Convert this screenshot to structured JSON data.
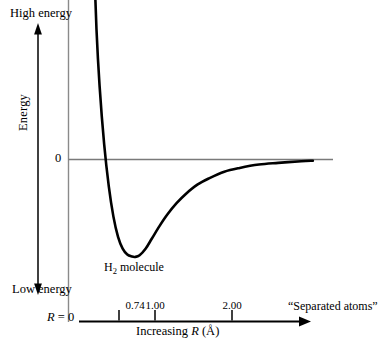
{
  "figure": {
    "kind": "potential-energy-curve",
    "background_color": "#ffffff",
    "line_color": "#000000",
    "axis_color": "#6b6b6b"
  },
  "labels": {
    "high_energy": "High energy",
    "low_energy": "Low energy",
    "energy_axis": "Energy",
    "zero": "0",
    "molecule_prefix": "H",
    "molecule_subscript": "2",
    "molecule_suffix": " molecule",
    "r_zero_symbol": "R",
    "r_zero_rest": " = 0",
    "separated_atoms": "“Separated atoms”",
    "xaxis_prefix": "Increasing ",
    "xaxis_symbol": "R",
    "xaxis_units": " (Å)"
  },
  "chart_data": {
    "type": "line",
    "title": "",
    "subtitle": "",
    "xlabel": "Increasing R (Å)",
    "ylabel": "Energy",
    "grid": false,
    "legend": null,
    "xlim": [
      0,
      3.1
    ],
    "ylim_note": "Energy axis unlabeled numerically; only zero level marked",
    "x_tick_labels": [
      "0.74",
      "1.00",
      "2.00"
    ],
    "x_tick_values": [
      0.74,
      1.0,
      2.0
    ],
    "y_tick_labels": [
      "0"
    ],
    "y_tick_values": [
      0
    ],
    "annotations": [
      {
        "text": "High energy",
        "position": "top of energy axis"
      },
      {
        "text": "Low energy",
        "position": "bottom of energy axis"
      },
      {
        "text": "H2 molecule",
        "position": "below curve minimum at R = 0.74"
      },
      {
        "text": "“Separated atoms”",
        "position": "right end of R axis"
      },
      {
        "text": "R = 0",
        "position": "origin of R axis"
      }
    ],
    "series": [
      {
        "name": "H2 potential energy",
        "description": "Morse-like potential: steep repulsive wall at small R, minimum at R = 0.74 A, asymptotic approach to zero energy at large R",
        "x": [
          0.12,
          0.16,
          0.2,
          0.24,
          0.28,
          0.34,
          0.4,
          0.46,
          0.52,
          0.58,
          0.64,
          0.7,
          0.74,
          0.8,
          0.88,
          0.96,
          1.06,
          1.16,
          1.28,
          1.4,
          1.55,
          1.7,
          1.9,
          2.1,
          2.35,
          2.6,
          2.9,
          3.05
        ],
        "y": [
          6.3,
          4.05,
          2.55,
          1.55,
          0.88,
          0.18,
          -0.32,
          -0.68,
          -0.92,
          -1.06,
          -1.13,
          -1.155,
          -1.16,
          -1.14,
          -1.06,
          -0.94,
          -0.79,
          -0.655,
          -0.52,
          -0.41,
          -0.3,
          -0.225,
          -0.145,
          -0.1,
          -0.06,
          -0.04,
          -0.02,
          -0.015
        ]
      }
    ],
    "zero_line": {
      "y": 0,
      "x_from": 0.0,
      "x_to": 2.95,
      "color": "#7a7a7a"
    }
  },
  "axes": {
    "energy_arrow": {
      "direction": "both",
      "orientation": "vertical"
    },
    "r_axis_arrow": {
      "direction": "right",
      "orientation": "horizontal"
    }
  }
}
